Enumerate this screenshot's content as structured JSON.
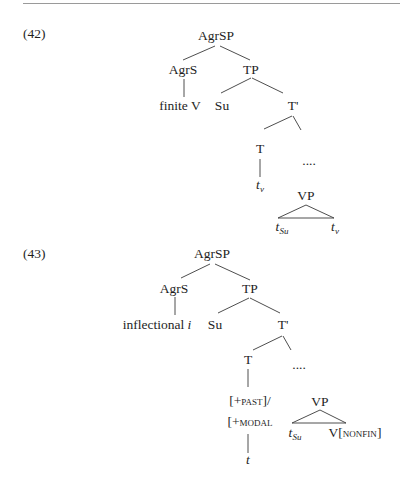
{
  "examples": [
    {
      "number": "(42)",
      "nodes": {
        "root": "AgrSP",
        "agrs": "AgrS",
        "agrs_child": "finite V",
        "tp": "TP",
        "su": "Su",
        "tbar": "T'",
        "t": "T",
        "t_child_base": "t",
        "t_child_sub": "v",
        "dots": "....",
        "vp": "VP",
        "vp_left_base": "t",
        "vp_left_sub": "Su",
        "vp_right_base": "t",
        "vp_right_sub": "v"
      }
    },
    {
      "number": "(43)",
      "nodes": {
        "root": "AgrSP",
        "agrs": "AgrS",
        "agrs_child_text": "inflectional ",
        "agrs_child_italic": "i",
        "tp": "TP",
        "su": "Su",
        "tbar": "T'",
        "t": "T",
        "feature1_open": "[+",
        "feature1_sc": "past",
        "feature1_close": "]/",
        "feature2_open": "[+",
        "feature2_sc": "modal",
        "t_trace": "t",
        "dots": "....",
        "vp": "VP",
        "vp_left_base": "t",
        "vp_left_sub": "Su",
        "vp_right_text": "V[",
        "vp_right_sc": "nonfin",
        "vp_right_close": "]"
      }
    }
  ]
}
